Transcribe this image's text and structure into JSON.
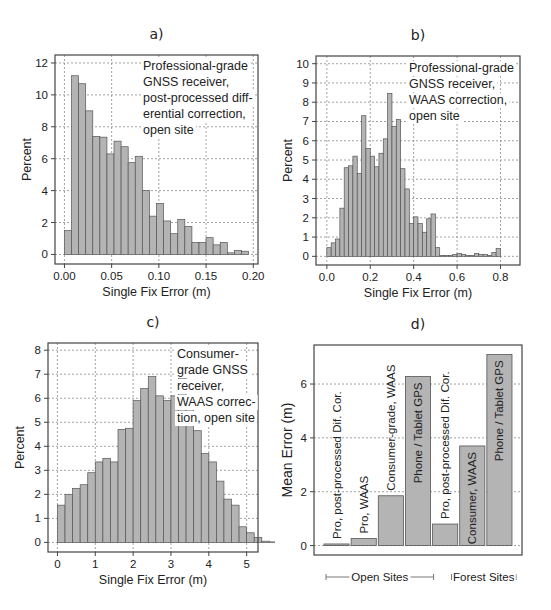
{
  "chart_data": [
    {
      "id": "a",
      "panel_label": "a)",
      "type": "bar",
      "subtype": "histogram",
      "title": "",
      "annotation": [
        "Professional-grade",
        "GNSS receiver,",
        "post-processed diff-",
        "erential correction,",
        "open site"
      ],
      "xlabel": "Single Fix Error (m)",
      "ylabel": "Percent",
      "xlim": [
        -0.01,
        0.205
      ],
      "ylim": [
        -0.6,
        12.5
      ],
      "xticks": [
        0.0,
        0.05,
        0.1,
        0.15,
        0.2
      ],
      "xtick_labels": [
        "0.00",
        "0.05",
        "0.10",
        "0.15",
        "0.20"
      ],
      "yticks": [
        0,
        2,
        4,
        6,
        8,
        10,
        12
      ],
      "ytick_labels": [
        "0",
        "2",
        "4",
        "6",
        "8",
        "10",
        "12"
      ],
      "grid": true,
      "bin_start": 0.0,
      "bin_width": 0.0075,
      "values": [
        1.5,
        11.2,
        10.7,
        9.0,
        7.4,
        7.35,
        6.3,
        7.1,
        6.75,
        5.75,
        6.15,
        4.0,
        2.4,
        3.2,
        2.1,
        1.3,
        2.2,
        1.75,
        0.75,
        0.75,
        1.05,
        0.6,
        0.75,
        0.1,
        0.25,
        0.2
      ],
      "frame": {
        "left": 55,
        "top": 55,
        "right": 258,
        "bottom": 264
      }
    },
    {
      "id": "b",
      "panel_label": "b)",
      "type": "bar",
      "subtype": "histogram",
      "title": "",
      "annotation": [
        "Professional-grade",
        "GNSS receiver,",
        "WAAS correction,",
        "open site"
      ],
      "xlabel": "Single Fix Error (m)",
      "ylabel": "Percent",
      "xlim": [
        -0.05,
        0.89
      ],
      "ylim": [
        -0.45,
        10.4
      ],
      "xticks": [
        0.0,
        0.2,
        0.4,
        0.6,
        0.8
      ],
      "xtick_labels": [
        "0.0",
        "0.2",
        "0.4",
        "0.6",
        "0.8"
      ],
      "yticks": [
        0,
        1,
        2,
        3,
        4,
        5,
        6,
        7,
        8,
        9,
        10
      ],
      "ytick_labels": [
        "0",
        "1",
        "2",
        "3",
        "4",
        "5",
        "6",
        "7",
        "8",
        "9",
        "10"
      ],
      "grid": true,
      "bin_start": 0.0,
      "bin_width": 0.02,
      "values": [
        0.45,
        0.7,
        0.9,
        2.5,
        4.6,
        4.7,
        5.2,
        4.3,
        7.3,
        5.6,
        5.2,
        4.65,
        5.35,
        6.1,
        8.45,
        6.75,
        7.1,
        4.55,
        3.5,
        1.7,
        2.05,
        1.7,
        1.25,
        1.95,
        2.2,
        0.45,
        0.05,
        0.05,
        0.05,
        0.1,
        0.15,
        0.1,
        0.05,
        0.05,
        0.15,
        0.1,
        0.1,
        0.05,
        0.2,
        0.4
      ],
      "frame": {
        "left": 316,
        "top": 56,
        "right": 520,
        "bottom": 265
      }
    },
    {
      "id": "c",
      "panel_label": "c)",
      "type": "bar",
      "subtype": "histogram",
      "title": "",
      "annotation": [
        "Consumer-",
        "grade GNSS",
        "receiver,",
        "WAAS correc-",
        "tion, open site"
      ],
      "xlabel": "Single Fix Error (m)",
      "ylabel": "Percent",
      "xlim": [
        -0.25,
        5.3
      ],
      "ylim": [
        -0.4,
        8.3
      ],
      "xticks": [
        0,
        1,
        2,
        3,
        4,
        5
      ],
      "xtick_labels": [
        "0",
        "1",
        "2",
        "3",
        "4",
        "5"
      ],
      "yticks": [
        0,
        1,
        2,
        3,
        4,
        5,
        6,
        7,
        8
      ],
      "ytick_labels": [
        "0",
        "1",
        "2",
        "3",
        "4",
        "5",
        "6",
        "7",
        "8"
      ],
      "grid": true,
      "bin_start": 0.0,
      "bin_width": 0.2,
      "values": [
        1.55,
        2.0,
        2.25,
        2.4,
        2.9,
        3.35,
        3.5,
        3.35,
        4.7,
        4.75,
        5.9,
        6.4,
        6.9,
        6.1,
        5.9,
        6.1,
        6.85,
        5.9,
        4.65,
        3.7,
        3.35,
        2.55,
        1.8,
        1.55,
        0.65,
        0.4,
        0.2,
        0.05,
        0.02,
        0.01,
        0.01,
        0.01,
        0.01,
        0.01
      ],
      "frame": {
        "left": 48,
        "top": 343,
        "right": 258,
        "bottom": 552
      }
    },
    {
      "id": "d",
      "panel_label": "d)",
      "type": "bar",
      "title": "",
      "xlabel": "",
      "ylabel": "Mean Error (m)",
      "ylim": [
        -0.35,
        7.45
      ],
      "yticks": [
        0,
        2,
        4,
        6
      ],
      "ytick_labels": [
        "0",
        "2",
        "4",
        "6"
      ],
      "grid": true,
      "categories": [
        "Pro, post-processed Dif. Cor.",
        "Pro, WAAS",
        "Consumer-grade, WAAS",
        "Phone / Tablet GPS",
        "Pro, post-processed Dif. Cor.",
        "Consumer, WAAS",
        "Phone / Tablet GPS"
      ],
      "groups": [
        "Open Sites",
        "Open Sites",
        "Open Sites",
        "Open Sites",
        "Forest Sites",
        "Forest Sites",
        "Forest Sites"
      ],
      "values": [
        0.06,
        0.26,
        1.85,
        6.28,
        0.8,
        3.7,
        7.1
      ],
      "label_position": [
        "above",
        "above",
        "above",
        "inside",
        "above",
        "inside",
        "inside"
      ],
      "group_labels": [
        "Open Sites",
        "Forest Sites"
      ],
      "frame": {
        "left": 314,
        "top": 345,
        "right": 522,
        "bottom": 555
      }
    }
  ]
}
